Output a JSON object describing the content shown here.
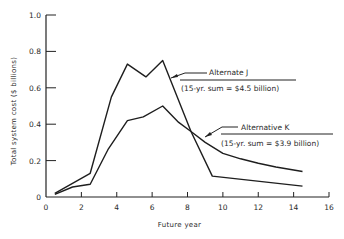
{
  "chart_data": {
    "type": "line",
    "title": "",
    "xlabel": "Future year",
    "ylabel": "Total system cost ($ billions)",
    "xlim": [
      0,
      16
    ],
    "ylim": [
      0,
      1.0
    ],
    "x_ticks": [
      0,
      2,
      4,
      6,
      8,
      10,
      12,
      14,
      16
    ],
    "y_ticks": [
      0,
      0.2,
      0.4,
      0.6,
      0.8,
      1.0
    ],
    "y_tick_labels": [
      "0",
      "0.2",
      "0.4",
      "0.6",
      "0.8",
      "1.0"
    ],
    "grid": false,
    "legend": "annotations",
    "series": [
      {
        "name": "Alternate J",
        "note": "(15-yr. sum = $4.5 billion)",
        "points": [
          [
            0.5,
            0.02
          ],
          [
            2.5,
            0.13
          ],
          [
            3.7,
            0.55
          ],
          [
            4.6,
            0.73
          ],
          [
            5.65,
            0.66
          ],
          [
            6.6,
            0.75
          ],
          [
            8.2,
            0.36
          ],
          [
            9.4,
            0.115
          ],
          [
            14.5,
            0.06
          ]
        ]
      },
      {
        "name": "Alternative K",
        "note": "(15-yr. sum = $3.9 billion)",
        "points": [
          [
            0.5,
            0.015
          ],
          [
            1.5,
            0.055
          ],
          [
            2.5,
            0.07
          ],
          [
            3.5,
            0.26
          ],
          [
            4.6,
            0.42
          ],
          [
            5.5,
            0.44
          ],
          [
            6.6,
            0.5
          ],
          [
            7.5,
            0.41
          ],
          [
            8.2,
            0.36
          ],
          [
            9.0,
            0.3
          ],
          [
            10.0,
            0.24
          ],
          [
            11.0,
            0.21
          ],
          [
            12.0,
            0.185
          ],
          [
            13.0,
            0.165
          ],
          [
            14.5,
            0.14
          ]
        ]
      }
    ]
  }
}
